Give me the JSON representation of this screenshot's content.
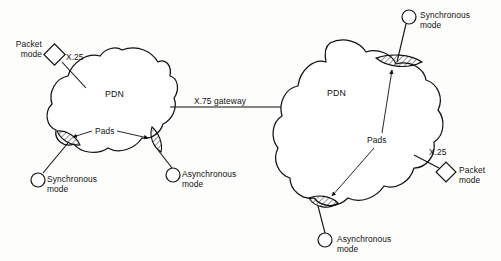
{
  "diagram": {
    "colors": {
      "ink": "#111111",
      "paper": "#ffffff",
      "hatch": "#111111"
    },
    "trunk": {
      "label": "X.75 gateway",
      "protocol": "X.75"
    },
    "left_network": {
      "cloud_label": "PDN",
      "pads_label": "Pads",
      "access_label": "X.25",
      "nodes": {
        "packet_mode": "Packet\nmode",
        "synchronous_mode": "Synchronous\nmode",
        "asynchronous_mode": "Asynchronous\nmode"
      }
    },
    "right_network": {
      "cloud_label": "PDN",
      "pads_label": "Pads",
      "access_label": "X.25",
      "nodes": {
        "synchronous_mode": "Synchronous\nmode",
        "packet_mode": "Packet\nmode",
        "asynchronous_mode": "Asynchronous\nmode"
      }
    }
  }
}
